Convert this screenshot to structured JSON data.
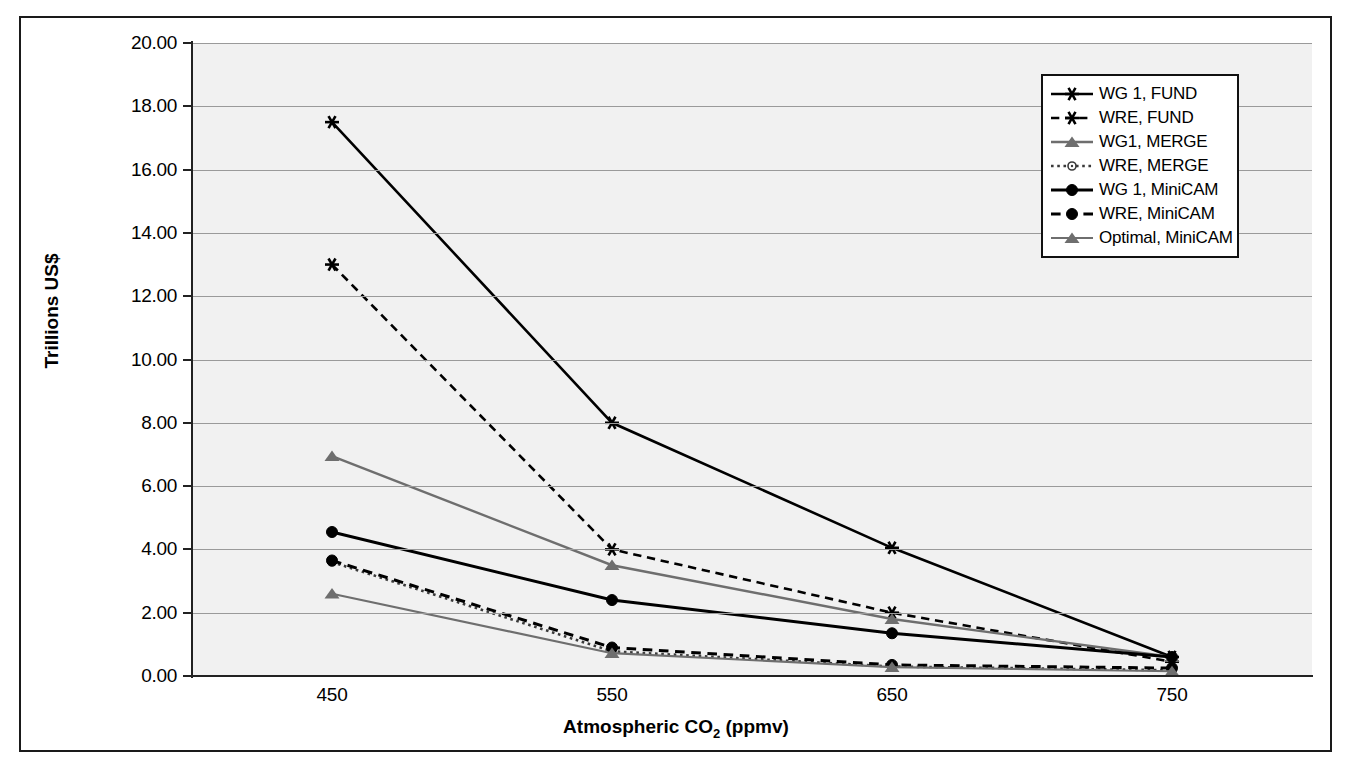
{
  "chart_data": {
    "type": "line",
    "title": "",
    "xlabel": "Atmospheric CO2 (ppmv)",
    "xlabel_main": "Atmospheric CO",
    "xlabel_sub": "2",
    "xlabel_tail": " (ppmv)",
    "ylabel": "Trillions US$",
    "x": [
      450,
      550,
      650,
      750
    ],
    "xticklabels": [
      "450",
      "550",
      "650",
      "750"
    ],
    "yticklabels": [
      "0.00",
      "2.00",
      "4.00",
      "6.00",
      "8.00",
      "10.00",
      "12.00",
      "14.00",
      "16.00",
      "18.00",
      "20.00"
    ],
    "ylim": [
      0,
      20
    ],
    "ytick_step": 2,
    "grid": "horizontal",
    "legend_position": "top-right",
    "plot_background": "#f1f1f1",
    "series": [
      {
        "name": "WG 1, FUND",
        "values": [
          17.5,
          8.0,
          4.05,
          0.6
        ],
        "color": "#000000",
        "dash": "none",
        "marker": "star",
        "width": 2.6
      },
      {
        "name": "WRE,  FUND",
        "values": [
          13.0,
          4.0,
          2.0,
          0.45
        ],
        "color": "#000000",
        "dash": "dashed",
        "marker": "star",
        "width": 2.6
      },
      {
        "name": "WG1, MERGE",
        "values": [
          6.95,
          3.5,
          1.8,
          0.6
        ],
        "color": "#6e6e6e",
        "dash": "none",
        "marker": "triangle",
        "width": 2.4
      },
      {
        "name": "WRE, MERGE",
        "values": [
          3.6,
          0.78,
          0.3,
          0.18
        ],
        "color": "#3a3a3a",
        "dash": "dotted",
        "marker": "circle-open",
        "width": 2.6
      },
      {
        "name": "WG 1, MiniCAM",
        "values": [
          4.55,
          2.4,
          1.35,
          0.6
        ],
        "color": "#000000",
        "dash": "none",
        "marker": "circle",
        "width": 3.0
      },
      {
        "name": "WRE, MiniCAM",
        "values": [
          3.65,
          0.9,
          0.35,
          0.25
        ],
        "color": "#000000",
        "dash": "dashed",
        "marker": "circle",
        "width": 3.0
      },
      {
        "name": "Optimal, MiniCAM",
        "values": [
          2.6,
          0.72,
          0.28,
          0.15
        ],
        "color": "#6e6e6e",
        "dash": "none",
        "marker": "triangle",
        "width": 2.2
      }
    ]
  }
}
